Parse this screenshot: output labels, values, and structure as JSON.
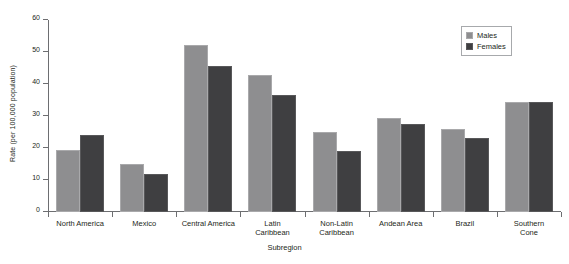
{
  "chart_data": {
    "type": "bar",
    "title": "",
    "xlabel": "Subregion",
    "ylabel": "Rate (per 100,000 population)",
    "ylim": [
      0,
      60
    ],
    "ytick_values": [
      0,
      10,
      20,
      30,
      40,
      50,
      60
    ],
    "ytick_labels": [
      "0",
      "10",
      "20",
      "30",
      "40",
      "50",
      "60"
    ],
    "grid": false,
    "legend_position": "top-right",
    "categories": [
      "North America",
      "Mexico",
      "Central America",
      "Latin Caribbean",
      "Non-Latin Caribbean",
      "Andean Area",
      "Brazil",
      "Southern Cone"
    ],
    "category_label_lines": [
      [
        "North America"
      ],
      [
        "Mexico"
      ],
      [
        "Central America"
      ],
      [
        "Latin",
        "Caribbean"
      ],
      [
        "Non-Latin",
        "Caribbean"
      ],
      [
        "Andean Area"
      ],
      [
        "Brazil"
      ],
      [
        "Southern",
        "Cone"
      ]
    ],
    "series": [
      {
        "name": "Males",
        "color": "#8e8e90",
        "values": [
          19.5,
          15.0,
          52.3,
          42.7,
          25.0,
          29.5,
          26.0,
          34.3
        ]
      },
      {
        "name": "Females",
        "color": "#3f3f41",
        "values": [
          24.0,
          12.0,
          45.7,
          36.5,
          19.0,
          27.5,
          23.0,
          34.3
        ]
      }
    ]
  },
  "legend": {
    "items": [
      {
        "label": "Males",
        "swatch": "males-swatch"
      },
      {
        "label": "Females",
        "swatch": "females-swatch"
      }
    ]
  },
  "colors": {
    "males": "#8e8e90",
    "females": "#3f3f41",
    "axis": "#6d6e71",
    "text": "#231f20"
  }
}
